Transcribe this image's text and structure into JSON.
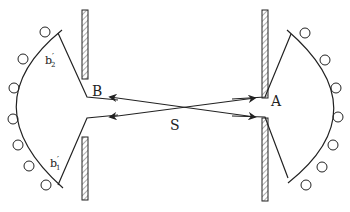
{
  "diagram": {
    "type": "optics-schematic",
    "labels": {
      "point_a": "A",
      "point_b": "B",
      "source": "S",
      "upper_left": "b",
      "upper_left_sub": "2",
      "lower_left": "b",
      "lower_left_sub": "1",
      "prime": "′"
    },
    "colors": {
      "stroke": "#222222",
      "background": "#ffffff"
    },
    "elements": {
      "left_barrier_segments": 2,
      "right_barrier_segments": 2,
      "left_circles": 7,
      "right_circles": 7,
      "crossing_rays": 2
    }
  }
}
